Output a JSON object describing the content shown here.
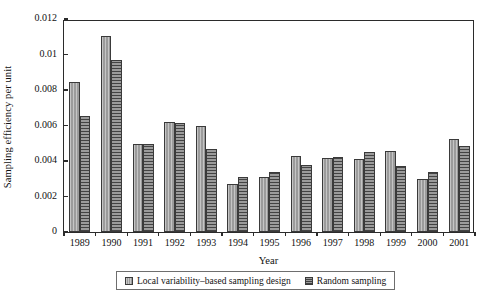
{
  "chart_data": {
    "type": "bar",
    "title": "",
    "xlabel": "Year",
    "ylabel": "Sampling efficiency per unit",
    "categories": [
      "1989",
      "1990",
      "1991",
      "1992",
      "1993",
      "1994",
      "1995",
      "1996",
      "1997",
      "1998",
      "1999",
      "2000",
      "2001"
    ],
    "ylim": [
      0,
      0.012
    ],
    "ytick_labels": [
      "0",
      "0.002",
      "0.004",
      "0.006",
      "0.008",
      "0.01",
      "0.012"
    ],
    "ytick_values": [
      0,
      0.002,
      0.004,
      0.006,
      0.008,
      0.01,
      0.012
    ],
    "grid": false,
    "legend_position": "bottom",
    "series": [
      {
        "name": "Local variability–based sampling design",
        "color": "#9b9b9b",
        "pattern": "vertical-stripe",
        "values": [
          0.00845,
          0.01105,
          0.00497,
          0.0062,
          0.00598,
          0.00268,
          0.0031,
          0.00428,
          0.00418,
          0.0041,
          0.00458,
          0.00298,
          0.00522
        ]
      },
      {
        "name": "Random sampling",
        "color": "#707070",
        "pattern": "horizontal-stripe",
        "values": [
          0.00653,
          0.00968,
          0.00498,
          0.00613,
          0.00468,
          0.0031,
          0.00338,
          0.00378,
          0.00425,
          0.00452,
          0.0037,
          0.0034,
          0.00483
        ]
      }
    ]
  },
  "legend": {
    "items": [
      {
        "label": "Local variability–based sampling design"
      },
      {
        "label": "Random sampling"
      }
    ]
  }
}
